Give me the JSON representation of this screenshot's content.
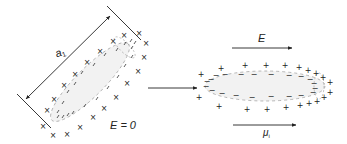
{
  "figure": {
    "left_panel": {
      "dimension_label": "a",
      "dimension_subscript": "1",
      "field_label": "E = 0",
      "outer_charge_symbol": "×",
      "inner_charge_symbol": "/"
    },
    "transition_arrow": "→",
    "right_panel": {
      "field_label": "E",
      "moment_label": "μ",
      "moment_subscript": "i",
      "outer_charge_symbol": "+",
      "inner_charge_symbol": "−"
    },
    "colors": {
      "ink": "#222222",
      "ellipse_fill": "#f2f2f2",
      "ellipse_stroke": "#888888"
    }
  }
}
